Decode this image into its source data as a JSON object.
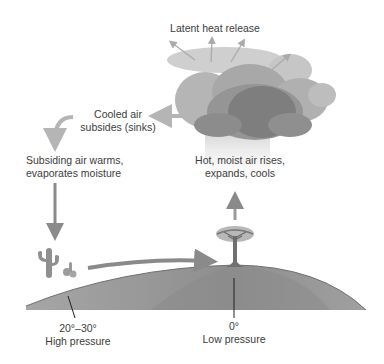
{
  "diagram": {
    "labels": {
      "latent_heat": "Latent heat release",
      "cooled_air_line1": "Cooled air",
      "cooled_air_line2": "subsides (sinks)",
      "subsiding_line1": "Subsiding air warms,",
      "subsiding_line2": "evaporates moisture",
      "hot_moist_line1": "Hot, moist air rises,",
      "hot_moist_line2": "expands, cools",
      "high_lat": "20°–30°",
      "high_pressure": "High pressure",
      "low_lat": "0°",
      "low_pressure": "Low pressure"
    },
    "colors": {
      "arrow": "#8a8a8a",
      "arrow_light": "#b3b3b3",
      "ground": "#9a9a9a",
      "ground_dark": "#858585",
      "cloud_light": "#c9c9c9",
      "cloud_mid": "#a9a9a9",
      "cloud_dark": "#7d7d7d",
      "tick": "#222222"
    }
  }
}
